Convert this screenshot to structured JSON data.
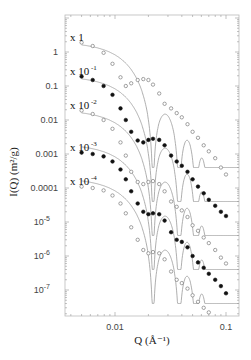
{
  "chart_data": {
    "type": "scatter",
    "title": "",
    "xlabel": "Q (Å⁻¹)",
    "ylabel": "I(Q) (m²/g)",
    "xscale": "log",
    "yscale": "log",
    "xlim": [
      0.0035,
      0.131
    ],
    "ylim": [
      1.5e-08,
      13
    ],
    "grid": false,
    "legend_position": "none",
    "x_ticks": [
      {
        "value": 0.01,
        "label": "0.01"
      },
      {
        "value": 0.1,
        "label": "0.1"
      }
    ],
    "y_ticks": [
      {
        "value": 1,
        "label": "1"
      },
      {
        "value": 0.1,
        "label": "0.1"
      },
      {
        "value": 0.01,
        "label": "0.01"
      },
      {
        "value": 0.001,
        "label": "0.001"
      },
      {
        "value": 0.0001,
        "label": "0.0001"
      },
      {
        "value": 1e-05,
        "label": "10",
        "exp": "-5"
      },
      {
        "value": 1e-06,
        "label": "10",
        "exp": "-6"
      },
      {
        "value": 1e-07,
        "label": "10",
        "exp": "-7"
      }
    ],
    "model": {
      "type": "sphere-form-factor",
      "radius_A": 204,
      "color": "#9a9a9a"
    },
    "series": [
      {
        "name": "x 1",
        "label_base": "x 1",
        "label_exp": "",
        "scale": 1,
        "I0": 2.0,
        "marker": "open-circle",
        "points": [
          [
            0.005,
            1.9
          ],
          [
            0.0063,
            1.5
          ],
          [
            0.0079,
            0.95
          ],
          [
            0.0095,
            0.45
          ],
          [
            0.0112,
            0.18
          ],
          [
            0.0125,
            0.1
          ],
          [
            0.014,
            0.12
          ],
          [
            0.016,
            0.15
          ],
          [
            0.018,
            0.16
          ],
          [
            0.02,
            0.15
          ],
          [
            0.022,
            0.11
          ],
          [
            0.025,
            0.06
          ],
          [
            0.028,
            0.03
          ],
          [
            0.032,
            0.022
          ],
          [
            0.036,
            0.016
          ],
          [
            0.04,
            0.012
          ],
          [
            0.045,
            0.0075
          ],
          [
            0.05,
            0.0045
          ],
          [
            0.056,
            0.003
          ],
          [
            0.063,
            0.0018
          ],
          [
            0.07,
            0.0012
          ],
          [
            0.08,
            0.00075
          ],
          [
            0.09,
            0.0004
          ],
          [
            0.1,
            0.00025
          ]
        ]
      },
      {
        "name": "x 10^-1",
        "label_base": "x 10",
        "label_exp": "-1",
        "scale": 0.1,
        "I0": 0.2,
        "marker": "filled-circle",
        "points": [
          [
            0.005,
            0.19
          ],
          [
            0.0063,
            0.15
          ],
          [
            0.0079,
            0.1
          ],
          [
            0.0095,
            0.055
          ],
          [
            0.0112,
            0.022
          ],
          [
            0.0125,
            0.01
          ],
          [
            0.014,
            0.0045
          ],
          [
            0.016,
            0.0025
          ],
          [
            0.018,
            0.0022
          ],
          [
            0.02,
            0.0026
          ],
          [
            0.022,
            0.0028
          ],
          [
            0.025,
            0.0026
          ],
          [
            0.028,
            0.0018
          ],
          [
            0.032,
            0.0009
          ],
          [
            0.036,
            0.0006
          ],
          [
            0.04,
            0.00045
          ],
          [
            0.045,
            0.0003
          ],
          [
            0.05,
            0.00018
          ],
          [
            0.056,
            0.00011
          ],
          [
            0.063,
            7e-05
          ],
          [
            0.07,
            4.5e-05
          ],
          [
            0.08,
            3e-05
          ],
          [
            0.09,
            2e-05
          ],
          [
            0.1,
            1.5e-05
          ]
        ]
      },
      {
        "name": "x 10^-2",
        "label_base": "x 10",
        "label_exp": "-2",
        "scale": 0.01,
        "I0": 0.02,
        "marker": "open-circle",
        "points": [
          [
            0.005,
            0.019
          ],
          [
            0.0063,
            0.015
          ],
          [
            0.0079,
            0.01
          ],
          [
            0.0095,
            0.0055
          ],
          [
            0.0112,
            0.0022
          ],
          [
            0.0125,
            0.0009
          ],
          [
            0.014,
            0.0003
          ],
          [
            0.016,
            0.00015
          ],
          [
            0.018,
            0.00013
          ],
          [
            0.02,
            0.00015
          ],
          [
            0.022,
            0.00016
          ],
          [
            0.025,
            0.00013
          ],
          [
            0.028,
            8e-05
          ],
          [
            0.032,
            4e-05
          ],
          [
            0.036,
            2.8e-05
          ],
          [
            0.04,
            2.2e-05
          ],
          [
            0.045,
            1.4e-05
          ],
          [
            0.05,
            8e-06
          ],
          [
            0.056,
            5.5e-06
          ],
          [
            0.063,
            3.5e-06
          ],
          [
            0.07,
            2.4e-06
          ],
          [
            0.08,
            1.5e-06
          ],
          [
            0.09,
            9e-07
          ],
          [
            0.1,
            6e-07
          ]
        ]
      },
      {
        "name": "x 10^-3",
        "label_base": "x 10",
        "label_exp": "-3",
        "scale": 0.001,
        "I0": 0.002,
        "marker": "filled-circle",
        "points": [
          [
            0.005,
            0.0011
          ],
          [
            0.0063,
            0.001
          ],
          [
            0.0079,
            0.00085
          ],
          [
            0.0095,
            0.0006
          ],
          [
            0.0112,
            0.00035
          ],
          [
            0.0125,
            0.00018
          ],
          [
            0.014,
            8e-05
          ],
          [
            0.016,
            3.5e-05
          ],
          [
            0.018,
            2e-05
          ],
          [
            0.02,
            1.7e-05
          ],
          [
            0.022,
            1.8e-05
          ],
          [
            0.025,
            1.7e-05
          ],
          [
            0.028,
            1.1e-05
          ],
          [
            0.032,
            5e-06
          ],
          [
            0.036,
            3e-06
          ],
          [
            0.04,
            2.6e-06
          ],
          [
            0.045,
            1.8e-06
          ],
          [
            0.05,
            1e-06
          ],
          [
            0.056,
            6.5e-07
          ],
          [
            0.063,
            4.5e-07
          ],
          [
            0.07,
            3e-07
          ],
          [
            0.08,
            2e-07
          ],
          [
            0.09,
            1.3e-07
          ],
          [
            0.1,
            8e-08
          ]
        ]
      },
      {
        "name": "x 10^-4",
        "label_base": "x 10",
        "label_exp": "-4",
        "scale": 0.0001,
        "I0": 0.0002,
        "marker": "open-circle",
        "points": [
          [
            0.005,
            0.00011
          ],
          [
            0.0063,
            0.0001
          ],
          [
            0.0079,
            8.5e-05
          ],
          [
            0.0095,
            6e-05
          ],
          [
            0.0112,
            3.5e-05
          ],
          [
            0.0125,
            1.8e-05
          ],
          [
            0.014,
            7e-06
          ],
          [
            0.016,
            3e-06
          ],
          [
            0.018,
            1.5e-06
          ],
          [
            0.02,
            1.2e-06
          ],
          [
            0.022,
            1.3e-06
          ],
          [
            0.025,
            1.2e-06
          ],
          [
            0.028,
            8e-07
          ],
          [
            0.032,
            3.5e-07
          ],
          [
            0.036,
            2e-07
          ],
          [
            0.04,
            1.6e-07
          ],
          [
            0.045,
            1.1e-07
          ],
          [
            0.05,
            7e-08
          ],
          [
            0.056,
            4.5e-08
          ],
          [
            0.063,
            3e-08
          ],
          [
            0.07,
            2.2e-08
          ],
          [
            0.08,
            1.5e-08
          ]
        ]
      }
    ]
  }
}
